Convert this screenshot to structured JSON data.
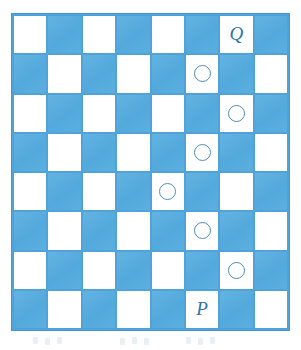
{
  "figure": {
    "type": "checkerboard-diagram",
    "rows": 8,
    "columns": 8,
    "colors": {
      "dark_square": "#5cafdf",
      "light_square": "#ffffff",
      "gridline": "#4fa3da",
      "label_text": "#2e74b0",
      "ring_stroke": "#4f8fba",
      "page_background": "#ffffff"
    },
    "top_left_square_shade": "light"
  },
  "board": {
    "squares": [
      [
        {
          "shade": "light",
          "mark": ""
        },
        {
          "shade": "dark",
          "mark": ""
        },
        {
          "shade": "light",
          "mark": ""
        },
        {
          "shade": "dark",
          "mark": ""
        },
        {
          "shade": "light",
          "mark": ""
        },
        {
          "shade": "dark",
          "mark": ""
        },
        {
          "shade": "light",
          "mark": "Q"
        },
        {
          "shade": "dark",
          "mark": ""
        }
      ],
      [
        {
          "shade": "dark",
          "mark": ""
        },
        {
          "shade": "light",
          "mark": ""
        },
        {
          "shade": "dark",
          "mark": ""
        },
        {
          "shade": "light",
          "mark": ""
        },
        {
          "shade": "dark",
          "mark": ""
        },
        {
          "shade": "light",
          "mark": "circle"
        },
        {
          "shade": "dark",
          "mark": ""
        },
        {
          "shade": "light",
          "mark": ""
        }
      ],
      [
        {
          "shade": "light",
          "mark": ""
        },
        {
          "shade": "dark",
          "mark": ""
        },
        {
          "shade": "light",
          "mark": ""
        },
        {
          "shade": "dark",
          "mark": ""
        },
        {
          "shade": "light",
          "mark": ""
        },
        {
          "shade": "dark",
          "mark": ""
        },
        {
          "shade": "light",
          "mark": "circle"
        },
        {
          "shade": "dark",
          "mark": ""
        }
      ],
      [
        {
          "shade": "dark",
          "mark": ""
        },
        {
          "shade": "light",
          "mark": ""
        },
        {
          "shade": "dark",
          "mark": ""
        },
        {
          "shade": "light",
          "mark": ""
        },
        {
          "shade": "dark",
          "mark": ""
        },
        {
          "shade": "light",
          "mark": "circle"
        },
        {
          "shade": "dark",
          "mark": ""
        },
        {
          "shade": "light",
          "mark": ""
        }
      ],
      [
        {
          "shade": "light",
          "mark": ""
        },
        {
          "shade": "dark",
          "mark": ""
        },
        {
          "shade": "light",
          "mark": ""
        },
        {
          "shade": "dark",
          "mark": ""
        },
        {
          "shade": "light",
          "mark": "circle"
        },
        {
          "shade": "dark",
          "mark": ""
        },
        {
          "shade": "light",
          "mark": ""
        },
        {
          "shade": "dark",
          "mark": ""
        }
      ],
      [
        {
          "shade": "dark",
          "mark": ""
        },
        {
          "shade": "light",
          "mark": ""
        },
        {
          "shade": "dark",
          "mark": ""
        },
        {
          "shade": "light",
          "mark": ""
        },
        {
          "shade": "dark",
          "mark": ""
        },
        {
          "shade": "light",
          "mark": "circle"
        },
        {
          "shade": "dark",
          "mark": ""
        },
        {
          "shade": "light",
          "mark": ""
        }
      ],
      [
        {
          "shade": "light",
          "mark": ""
        },
        {
          "shade": "dark",
          "mark": ""
        },
        {
          "shade": "light",
          "mark": ""
        },
        {
          "shade": "dark",
          "mark": ""
        },
        {
          "shade": "light",
          "mark": ""
        },
        {
          "shade": "dark",
          "mark": ""
        },
        {
          "shade": "light",
          "mark": "circle"
        },
        {
          "shade": "dark",
          "mark": ""
        }
      ],
      [
        {
          "shade": "dark",
          "mark": ""
        },
        {
          "shade": "light",
          "mark": ""
        },
        {
          "shade": "dark",
          "mark": ""
        },
        {
          "shade": "light",
          "mark": ""
        },
        {
          "shade": "dark",
          "mark": ""
        },
        {
          "shade": "light",
          "mark": "P"
        },
        {
          "shade": "dark",
          "mark": ""
        },
        {
          "shade": "light",
          "mark": ""
        }
      ]
    ],
    "labels": [
      {
        "text": "Q",
        "row": 1,
        "column": 7
      },
      {
        "text": "P",
        "row": 8,
        "column": 6
      }
    ],
    "circles": [
      {
        "row": 2,
        "column": 6
      },
      {
        "row": 3,
        "column": 7
      },
      {
        "row": 4,
        "column": 6
      },
      {
        "row": 5,
        "column": 5
      },
      {
        "row": 6,
        "column": 6
      },
      {
        "row": 7,
        "column": 7
      }
    ]
  }
}
